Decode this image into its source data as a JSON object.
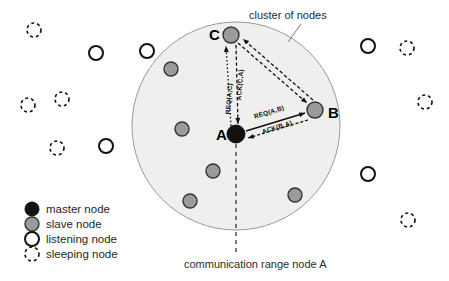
{
  "figure": {
    "background_color": "#ffffff",
    "cluster_fill": "#efefef",
    "cluster_stroke": "#9a9a9a",
    "master_color": "#111111",
    "slave_color": "#9b9b9b",
    "slave_stroke": "#333333",
    "listening_stroke": "#111111",
    "sleeping_stroke": "#111111",
    "line_color": "#111111"
  },
  "annotations": {
    "cluster_label": "cluster of nodes",
    "range_label": "communication range node A"
  },
  "nodes": {
    "master": {
      "id": "A",
      "label": "A",
      "x": 236,
      "y": 134,
      "r": 9
    },
    "slaves_labeled": [
      {
        "id": "B",
        "label": "B",
        "x": 315,
        "y": 110,
        "r": 8
      },
      {
        "id": "C",
        "label": "C",
        "x": 231,
        "y": 35,
        "r": 8
      }
    ],
    "slaves_unlabeled": [
      {
        "x": 171,
        "y": 69,
        "r": 7
      },
      {
        "x": 182,
        "y": 129,
        "r": 7
      },
      {
        "x": 213,
        "y": 171,
        "r": 7
      },
      {
        "x": 190,
        "y": 201,
        "r": 7
      },
      {
        "x": 295,
        "y": 195,
        "r": 7
      }
    ],
    "listening": [
      {
        "x": 147,
        "y": 51,
        "r": 7
      },
      {
        "x": 96,
        "y": 53,
        "r": 7
      },
      {
        "x": 106,
        "y": 146,
        "r": 7
      },
      {
        "x": 368,
        "y": 46,
        "r": 7
      },
      {
        "x": 368,
        "y": 174,
        "r": 7
      }
    ],
    "sleeping": [
      {
        "x": 34,
        "y": 30,
        "r": 7
      },
      {
        "x": 28,
        "y": 105,
        "r": 7
      },
      {
        "x": 62,
        "y": 99,
        "r": 7
      },
      {
        "x": 57,
        "y": 148,
        "r": 7
      },
      {
        "x": 407,
        "y": 48,
        "r": 7
      },
      {
        "x": 425,
        "y": 102,
        "r": 7
      },
      {
        "x": 408,
        "y": 220,
        "r": 7
      }
    ]
  },
  "cluster_circle": {
    "cx": 236,
    "cy": 126,
    "r": 104
  },
  "messages": [
    {
      "name": "req-a-b",
      "text": "REQ(A,B)",
      "from": "A",
      "to": "B",
      "style": "solid"
    },
    {
      "name": "ack-b-a",
      "text": "ACK(B,A)",
      "from": "B",
      "to": "A",
      "style": "dashed"
    },
    {
      "name": "req-a-c",
      "text": "REQ(A,C)",
      "from": "A",
      "to": "C",
      "style": "dotted"
    },
    {
      "name": "ack-c-a",
      "text": "ACK(C,A)",
      "from": "C",
      "to": "A",
      "style": "dashed"
    }
  ],
  "legend": {
    "items": [
      {
        "key": "master",
        "label": "master node",
        "marker": "filled-circle-icon"
      },
      {
        "key": "slave",
        "label": "slave node",
        "marker": "gray-circle-icon"
      },
      {
        "key": "listening",
        "label": "listening node",
        "marker": "hollow-circle-icon"
      },
      {
        "key": "sleeping",
        "label": "sleeping node",
        "marker": "dashed-circle-icon"
      }
    ]
  }
}
